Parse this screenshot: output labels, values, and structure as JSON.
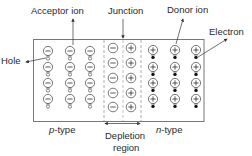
{
  "diagram": {
    "labels": {
      "acceptor_ion": "Acceptor ion",
      "junction": "Junction",
      "donor_ion": "Donor ion",
      "electron": "Electron",
      "hole": "Hole",
      "p_type_italic": "p",
      "p_type_rest": "-type",
      "n_type_italic": "n",
      "n_type_rest": "-type",
      "depletion_line1": "Depletion",
      "depletion_line2": "region"
    },
    "regions": {
      "p_type": {
        "ion": "minus",
        "carrier": "hole",
        "columns": 3,
        "rows": 4
      },
      "depletion": {
        "columns": [
          "minus",
          "plus"
        ],
        "rows": 5
      },
      "n_type": {
        "ion": "plus",
        "carrier": "electron",
        "columns": 3,
        "rows": 4
      }
    },
    "colors": {
      "stroke": "#555555",
      "border": "#777777",
      "electron": "#111111",
      "text": "#2a2a2a"
    }
  }
}
